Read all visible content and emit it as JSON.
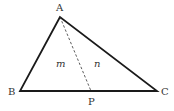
{
  "figure": {
    "type": "triangle-with-cevian",
    "vertices": {
      "A": {
        "label": "A",
        "x": 60,
        "y": 17
      },
      "B": {
        "label": "B",
        "x": 20,
        "y": 91
      },
      "C": {
        "label": "C",
        "x": 157,
        "y": 91
      },
      "P": {
        "label": "P",
        "x": 91,
        "y": 91
      }
    },
    "regions": {
      "left": {
        "label": "m"
      },
      "right": {
        "label": "n"
      }
    },
    "colors": {
      "stroke": "#1a1a1a",
      "dashed": "#333333",
      "text": "#333333"
    }
  }
}
